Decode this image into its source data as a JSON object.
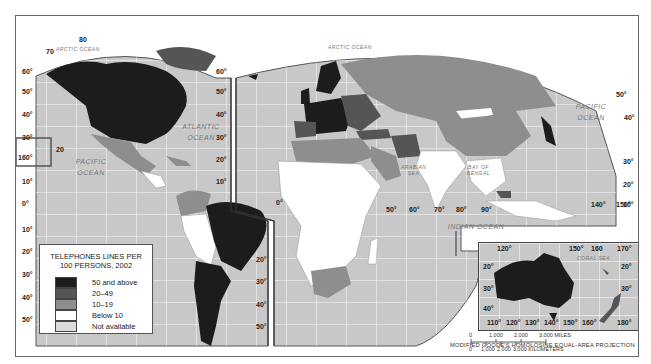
{
  "map": {
    "title": "Telephone lines per 100 persons, 2002",
    "projection": "MODIFIED GOODE'S HOMOLOSINE EQUAL-AREA PROJECTION",
    "oceans": [
      {
        "id": "arctic-west",
        "label": "ARCTIC OCEAN"
      },
      {
        "id": "arctic-east",
        "label": "ARCTIC OCEAN"
      },
      {
        "id": "atlantic",
        "label": "ATLANTIC OCEAN"
      },
      {
        "id": "pacific-west",
        "label": "PACIFIC OCEAN"
      },
      {
        "id": "pacific-east",
        "label": "PACIFIC OCEAN"
      },
      {
        "id": "indian",
        "label": "INDIAN OCEAN"
      },
      {
        "id": "arabian",
        "label": "ARABIAN SEA"
      },
      {
        "id": "bengal",
        "label": "BAY OF BENGAL"
      },
      {
        "id": "coral",
        "label": "CORAL SEA"
      }
    ],
    "latitude_labels": [
      "80",
      "70",
      "60°",
      "50°",
      "40°",
      "30°",
      "20°",
      "10°",
      "0°",
      "10°",
      "20°",
      "30°",
      "40°",
      "50°"
    ],
    "longitude_labels": [
      "160°",
      "20",
      "50°",
      "60°",
      "70°",
      "80°",
      "90°",
      "140°",
      "150°"
    ],
    "colors": {
      "ocean": "#c8c8c8",
      "grid": "#ffffff",
      "level_50_above": "#1c1c1c",
      "level_20_49": "#555555",
      "level_10_19": "#8e8e8e",
      "level_below_10": "#ffffff",
      "not_available": "#dcdcdc"
    }
  },
  "legend": {
    "title_line1": "TELEPHONES LINES PER",
    "title_line2": "100 PERSONS, 2002",
    "items": [
      {
        "label": "50 and above",
        "color": "#1c1c1c"
      },
      {
        "label": "20–49",
        "color": "#555555"
      },
      {
        "label": "10–19",
        "color": "#8e8e8e"
      },
      {
        "label": "Below 10",
        "color": "#ffffff"
      },
      {
        "label": "Not available",
        "color": "#dcdcdc"
      }
    ]
  },
  "inset": {
    "name": "Australia and New Zealand",
    "top_labels": [
      "120°",
      "150°",
      "160",
      "170°"
    ],
    "bottom_labels": [
      "110°",
      "120°",
      "130°",
      "140°",
      "150°",
      "160°",
      "180°"
    ],
    "left_labels": [
      "20°",
      "30°",
      "40°"
    ],
    "right_labels": [
      "20°",
      "30°"
    ]
  },
  "scale": {
    "miles": [
      "0",
      "1,000",
      "2,000",
      "3,000 MILES"
    ],
    "kilometers": [
      "0",
      "1,000",
      "2,000",
      "3,000 KILOMETERS"
    ]
  }
}
